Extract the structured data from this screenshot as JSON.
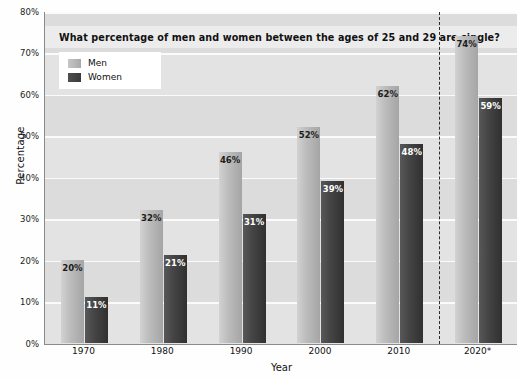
{
  "chart_data": {
    "type": "bar",
    "title": "What percentage of men and women between the ages of 25 and 29 are single?",
    "xlabel": "Year",
    "ylabel": "Percentage",
    "categories": [
      "1970",
      "1980",
      "1990",
      "2000",
      "2010",
      "2020*"
    ],
    "series": [
      {
        "name": "Men",
        "values": [
          20,
          32,
          46,
          52,
          62,
          74
        ],
        "color": "#bdbdbd"
      },
      {
        "name": "Women",
        "values": [
          11,
          21,
          31,
          39,
          48,
          59
        ],
        "color": "#3d3d3d"
      }
    ],
    "value_labels": {
      "men": [
        "20%",
        "32%",
        "46%",
        "52%",
        "62%",
        "74%"
      ],
      "women": [
        "11%",
        "21%",
        "31%",
        "39%",
        "48%",
        "59%"
      ]
    },
    "ylim": [
      0,
      80
    ],
    "yticks": [
      0,
      10,
      20,
      30,
      40,
      50,
      60,
      70,
      80
    ],
    "ytick_labels": [
      "0%",
      "10%",
      "20%",
      "30%",
      "40%",
      "50%",
      "60%",
      "70%",
      "80%"
    ],
    "grid": true,
    "legend_position": "top-left",
    "annotations": [
      {
        "name": "forecast-divider",
        "type": "vertical-dashed-line",
        "after_category": "2010"
      }
    ]
  },
  "colors": {
    "plot_background": "#e3e3e3",
    "gridline": "#fbfbfb",
    "band": "#dcdcdc",
    "axis": "#8a8a8a",
    "men_bar": "#bdbdbd",
    "women_bar": "#3d3d3d",
    "divider": "#2b2b2b",
    "legend_background": "#ffffff",
    "title_band": "#ececec"
  }
}
